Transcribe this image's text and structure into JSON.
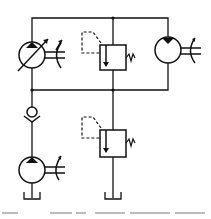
{
  "diagram": {
    "type": "hydraulic-circuit",
    "stroke_color": "#111111",
    "background": "#ffffff",
    "components": [
      {
        "id": "variable-pump",
        "kind": "variable displacement pump, variable drive",
        "position": "upper-left"
      },
      {
        "id": "relief-valve-upper",
        "kind": "pressure relief valve (pilot, spring adjustable)",
        "position": "upper-center"
      },
      {
        "id": "hydraulic-motor",
        "kind": "fixed displacement hydraulic motor, variable drive",
        "position": "upper-right"
      },
      {
        "id": "check-valve",
        "kind": "check valve",
        "position": "lower-left"
      },
      {
        "id": "charge-pump",
        "kind": "fixed displacement pump, variable drive",
        "position": "lower-left"
      },
      {
        "id": "relief-valve-lower",
        "kind": "pressure relief valve (pilot, spring adjustable)",
        "position": "lower-center"
      },
      {
        "id": "tank-left",
        "kind": "reservoir",
        "position": "bottom-left"
      },
      {
        "id": "tank-center",
        "kind": "reservoir",
        "position": "bottom-center"
      }
    ],
    "caption_visible": "illegible (cropped)"
  }
}
